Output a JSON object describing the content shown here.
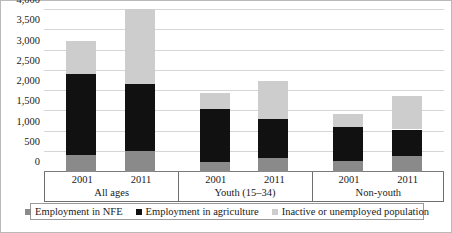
{
  "chart_data": {
    "type": "bar",
    "subtype": "stacked-bar",
    "title": "",
    "xlabel": "",
    "ylabel": "",
    "ylim": [
      0,
      4000
    ],
    "ytick_labels": [
      "0",
      "500",
      "1,000",
      "1,500",
      "2,000",
      "2,500",
      "3,000",
      "3,500",
      "4,000"
    ],
    "ytick_values": [
      0,
      500,
      1000,
      1500,
      2000,
      2500,
      3000,
      3500,
      4000
    ],
    "grid": true,
    "legend_position": "bottom",
    "groups": [
      {
        "label": "All ages",
        "years": [
          "2001",
          "2011"
        ]
      },
      {
        "label": "Youth (15–34)",
        "years": [
          "2001",
          "2011"
        ]
      },
      {
        "label": "Non-youth",
        "years": [
          "2001",
          "2011"
        ]
      }
    ],
    "categories": [
      "All ages 2001",
      "All ages 2011",
      "Youth (15–34) 2001",
      "Youth (15–34) 2011",
      "Non-youth 2001",
      "Non-youth 2011"
    ],
    "series": [
      {
        "name": "Employment in NFE",
        "color": "#8a8a8a",
        "values": [
          430,
          520,
          250,
          340,
          280,
          390
        ]
      },
      {
        "name": "Employment in agriculture",
        "color": "#111111",
        "values": [
          2000,
          1660,
          1310,
          960,
          840,
          660
        ]
      },
      {
        "name": "Inactive or unemployed population",
        "color": "#cdcdcd",
        "values": [
          800,
          1850,
          390,
          950,
          310,
          830
        ]
      }
    ],
    "totals": [
      3230,
      4030,
      1950,
      2250,
      1430,
      1880
    ]
  },
  "legend": {
    "items": [
      {
        "label": "Employment in NFE",
        "color": "#8a8a8a"
      },
      {
        "label": "Employment in agriculture",
        "color": "#111111"
      },
      {
        "label": "Inactive or unemployed population",
        "color": "#cdcdcd"
      }
    ]
  }
}
